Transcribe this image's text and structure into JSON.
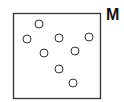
{
  "panel": {
    "label": "M",
    "box": {
      "x": 13,
      "y": 13,
      "width": 87,
      "height": 85,
      "stroke": "#333333"
    },
    "circle_style": {
      "radius": 4,
      "stroke": "#333333",
      "fill": "#ffffff"
    },
    "circles": [
      {
        "cx": 39,
        "cy": 24
      },
      {
        "cx": 27,
        "cy": 39
      },
      {
        "cx": 59,
        "cy": 38
      },
      {
        "cx": 89,
        "cy": 37
      },
      {
        "cx": 44,
        "cy": 53
      },
      {
        "cx": 75,
        "cy": 51
      },
      {
        "cx": 59,
        "cy": 69
      },
      {
        "cx": 73,
        "cy": 83
      }
    ]
  }
}
